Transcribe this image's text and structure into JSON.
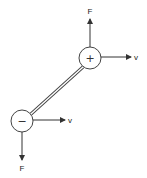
{
  "diagram": {
    "title": "",
    "colors": {
      "stroke": "#333333",
      "background": "#ffffff"
    },
    "charges": [
      {
        "id": "positive",
        "sign": "+",
        "center": [
          90,
          58
        ],
        "radius": 11
      },
      {
        "id": "negative",
        "sign": "−",
        "center": [
          22,
          121
        ],
        "radius": 11
      }
    ],
    "rod": {
      "from": [
        82,
        66
      ],
      "to": [
        30,
        113
      ],
      "style": "double-line"
    },
    "arrows": [
      {
        "id": "force-top",
        "label": "F",
        "direction": "up",
        "from": [
          90,
          47
        ],
        "to": [
          90,
          18
        ]
      },
      {
        "id": "velocity-top",
        "label": "v",
        "direction": "right",
        "from": [
          101,
          57
        ],
        "to": [
          132,
          57
        ]
      },
      {
        "id": "velocity-bottom",
        "label": "v",
        "direction": "right",
        "from": [
          33,
          120
        ],
        "to": [
          66,
          120
        ]
      },
      {
        "id": "force-bottom",
        "label": "F",
        "direction": "down",
        "from": [
          22,
          132
        ],
        "to": [
          22,
          160
        ]
      }
    ]
  }
}
